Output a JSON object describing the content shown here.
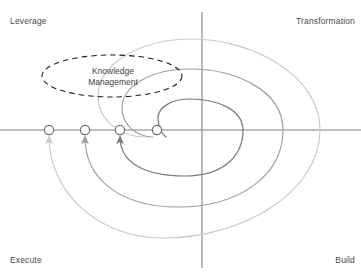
{
  "diagram": {
    "title_labels": {
      "top_left": "Leverage",
      "top_right": "Transformation",
      "bottom_left": "Execute",
      "bottom_right": "Build"
    },
    "bubble": {
      "line1": "Knowledge",
      "line2": "Management",
      "style": "dashed-ellipse",
      "stroke": "#1a1a1a",
      "cx": 112,
      "cy": 76,
      "rx": 70,
      "ry": 21
    },
    "axes": {
      "x_axis_y": 130,
      "y_axis_x": 202,
      "stroke": "#808080",
      "x_from": 0,
      "x_to": 361,
      "y_from": 12,
      "y_to": 268
    },
    "markers": [
      {
        "id": "marker-1",
        "cx": 49,
        "cy": 130,
        "r": 4.6,
        "stroke": "#6e6e6e",
        "fill": "#ffffff"
      },
      {
        "id": "marker-2",
        "cx": 85,
        "cy": 130,
        "r": 4.6,
        "stroke": "#6e6e6e",
        "fill": "#ffffff"
      },
      {
        "id": "marker-3",
        "cx": 120,
        "cy": 130,
        "r": 4.6,
        "stroke": "#6e6e6e",
        "fill": "#ffffff"
      },
      {
        "id": "marker-4",
        "cx": 157,
        "cy": 130,
        "r": 4.6,
        "stroke": "#6e6e6e",
        "fill": "#ffffff"
      }
    ],
    "spirals": [
      {
        "id": "spiral-inner",
        "color": "#7a7a7a",
        "width": 1.1,
        "arrow_to_marker": 3,
        "right_x": 243,
        "top_y": 99,
        "bottom_y": 176
      },
      {
        "id": "spiral-middle",
        "color": "#9e9e9e",
        "width": 1.1,
        "arrow_to_marker": 2,
        "right_x": 283,
        "top_y": 69,
        "bottom_y": 207
      },
      {
        "id": "spiral-outer",
        "color": "#c9c9c9",
        "width": 1.1,
        "arrow_to_marker": 1,
        "right_x": 320,
        "top_y": 39,
        "bottom_y": 238
      }
    ],
    "colors": {
      "axis": "#808080",
      "text": "#4a4a4a",
      "bubble_stroke": "#1a1a1a",
      "background": "#ffffff"
    }
  }
}
